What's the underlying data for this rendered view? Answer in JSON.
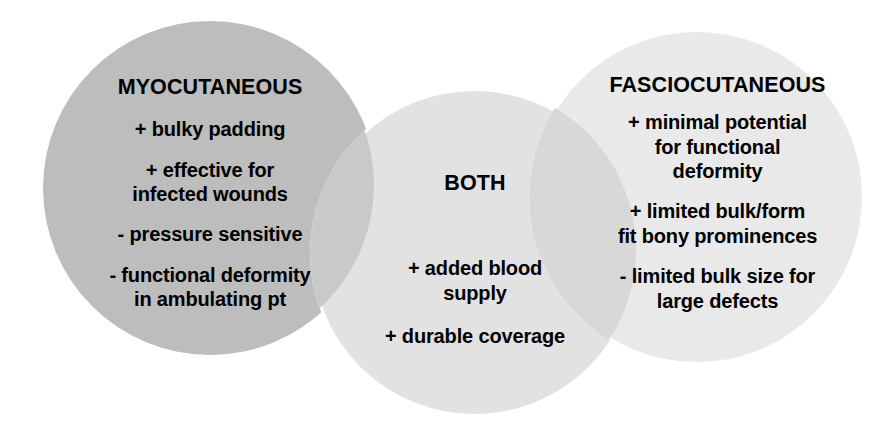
{
  "diagram": {
    "type": "venn-diagram",
    "background_color": "#ffffff",
    "groups": [
      {
        "id": "myocutaneous",
        "title": "MYOCUTANEOUS",
        "fill_color": "#bdbdbd",
        "items": [
          "+ bulky padding",
          "+ effective for\ninfected wounds",
          "- pressure sensitive",
          "- functional deformity\nin ambulating pt"
        ]
      },
      {
        "id": "both",
        "title": "BOTH",
        "fill_color": "#e2e2e3",
        "items": [
          "+ added blood\nsupply",
          "+ durable coverage"
        ]
      },
      {
        "id": "fasciocutaneous",
        "title": "FASCIOCUTANEOUS",
        "fill_color": "#e9e9ea",
        "items": [
          "+ minimal potential\nfor functional\ndeformity",
          "+ limited bulk/form\nfit bony prominences",
          "- limited bulk size for\nlarge defects"
        ]
      }
    ]
  }
}
